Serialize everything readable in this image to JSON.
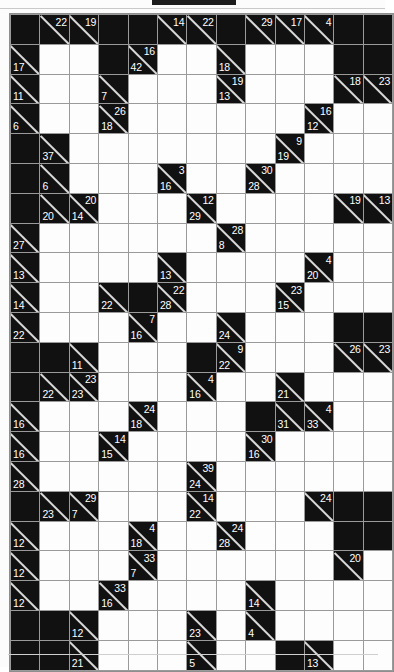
{
  "puzzle": {
    "type": "kakuro",
    "columns": 13,
    "rows": 22,
    "colors": {
      "block": "#111111",
      "open": "#fdfdfd",
      "grid_line": "#9a9a9a",
      "clue_text": "#ffffff",
      "diagonal": "#d8d8d8"
    },
    "legend": {
      "across_label": "across-clue (upper-right)",
      "down_label": "down-clue (lower-left)"
    },
    "cells": [
      [
        {
          "t": "b"
        },
        {
          "t": "c",
          "a": 22
        },
        {
          "t": "c",
          "a": 19
        },
        {
          "t": "b"
        },
        {
          "t": "b"
        },
        {
          "t": "c",
          "a": 14
        },
        {
          "t": "c",
          "a": 22
        },
        {
          "t": "b"
        },
        {
          "t": "c",
          "a": 29
        },
        {
          "t": "c",
          "a": 17
        },
        {
          "t": "c",
          "a": 4
        },
        {
          "t": "b"
        },
        {
          "t": "b"
        }
      ],
      [
        {
          "t": "c",
          "d": 17
        },
        {
          "t": "o"
        },
        {
          "t": "o"
        },
        {
          "t": "b"
        },
        {
          "t": "c",
          "a": 16,
          "d": 42
        },
        {
          "t": "o"
        },
        {
          "t": "o"
        },
        {
          "t": "c",
          "d": 18
        },
        {
          "t": "o"
        },
        {
          "t": "o"
        },
        {
          "t": "o"
        },
        {
          "t": "b"
        },
        {
          "t": "b"
        }
      ],
      [
        {
          "t": "c",
          "d": 11
        },
        {
          "t": "o"
        },
        {
          "t": "o"
        },
        {
          "t": "c",
          "d": 7
        },
        {
          "t": "o"
        },
        {
          "t": "o"
        },
        {
          "t": "o"
        },
        {
          "t": "c",
          "a": 19,
          "d": 13
        },
        {
          "t": "o"
        },
        {
          "t": "o"
        },
        {
          "t": "o"
        },
        {
          "t": "c",
          "a": 18
        },
        {
          "t": "c",
          "a": 23
        }
      ],
      [
        {
          "t": "c",
          "d": 6
        },
        {
          "t": "o"
        },
        {
          "t": "o"
        },
        {
          "t": "c",
          "a": 26,
          "d": 18
        },
        {
          "t": "o"
        },
        {
          "t": "o"
        },
        {
          "t": "o"
        },
        {
          "t": "o"
        },
        {
          "t": "o"
        },
        {
          "t": "o"
        },
        {
          "t": "c",
          "a": 16,
          "d": 12
        },
        {
          "t": "o"
        },
        {
          "t": "o"
        }
      ],
      [
        {
          "t": "b"
        },
        {
          "t": "c",
          "d": 37
        },
        {
          "t": "o"
        },
        {
          "t": "o"
        },
        {
          "t": "o"
        },
        {
          "t": "o"
        },
        {
          "t": "o"
        },
        {
          "t": "o"
        },
        {
          "t": "o"
        },
        {
          "t": "c",
          "a": 9,
          "d": 19
        },
        {
          "t": "o"
        },
        {
          "t": "o"
        },
        {
          "t": "o"
        }
      ],
      [
        {
          "t": "b"
        },
        {
          "t": "c",
          "d": 6
        },
        {
          "t": "o"
        },
        {
          "t": "o"
        },
        {
          "t": "o"
        },
        {
          "t": "c",
          "a": 3,
          "d": 16
        },
        {
          "t": "o"
        },
        {
          "t": "o"
        },
        {
          "t": "c",
          "a": 30,
          "d": 28
        },
        {
          "t": "o"
        },
        {
          "t": "o"
        },
        {
          "t": "o"
        },
        {
          "t": "o"
        }
      ],
      [
        {
          "t": "b"
        },
        {
          "t": "c",
          "d": 20
        },
        {
          "t": "c",
          "a": 20,
          "d": 14
        },
        {
          "t": "o"
        },
        {
          "t": "o"
        },
        {
          "t": "o"
        },
        {
          "t": "c",
          "a": 12,
          "d": 29
        },
        {
          "t": "o"
        },
        {
          "t": "o"
        },
        {
          "t": "o"
        },
        {
          "t": "o"
        },
        {
          "t": "c",
          "a": 19
        },
        {
          "t": "c",
          "a": 13
        }
      ],
      [
        {
          "t": "c",
          "d": 27
        },
        {
          "t": "o"
        },
        {
          "t": "o"
        },
        {
          "t": "o"
        },
        {
          "t": "o"
        },
        {
          "t": "o"
        },
        {
          "t": "o"
        },
        {
          "t": "c",
          "a": 28,
          "d": 8
        },
        {
          "t": "o"
        },
        {
          "t": "o"
        },
        {
          "t": "o"
        },
        {
          "t": "o"
        },
        {
          "t": "o"
        }
      ],
      [
        {
          "t": "c",
          "d": 13
        },
        {
          "t": "o"
        },
        {
          "t": "o"
        },
        {
          "t": "o"
        },
        {
          "t": "o"
        },
        {
          "t": "c",
          "d": 13
        },
        {
          "t": "o"
        },
        {
          "t": "o"
        },
        {
          "t": "o"
        },
        {
          "t": "o"
        },
        {
          "t": "c",
          "a": 4,
          "d": 20
        },
        {
          "t": "o"
        },
        {
          "t": "o"
        }
      ],
      [
        {
          "t": "c",
          "d": 14
        },
        {
          "t": "o"
        },
        {
          "t": "o"
        },
        {
          "t": "c",
          "d": 22
        },
        {
          "t": "b"
        },
        {
          "t": "c",
          "a": 22,
          "d": 28
        },
        {
          "t": "o"
        },
        {
          "t": "o"
        },
        {
          "t": "o"
        },
        {
          "t": "c",
          "a": 23,
          "d": 15
        },
        {
          "t": "o"
        },
        {
          "t": "o"
        },
        {
          "t": "o"
        }
      ],
      [
        {
          "t": "c",
          "d": 22
        },
        {
          "t": "o"
        },
        {
          "t": "o"
        },
        {
          "t": "o"
        },
        {
          "t": "c",
          "a": 7,
          "d": 16
        },
        {
          "t": "o"
        },
        {
          "t": "o"
        },
        {
          "t": "c",
          "d": 24
        },
        {
          "t": "o"
        },
        {
          "t": "o"
        },
        {
          "t": "o"
        },
        {
          "t": "b"
        },
        {
          "t": "b"
        }
      ],
      [
        {
          "t": "b"
        },
        {
          "t": "b"
        },
        {
          "t": "c",
          "d": 11
        },
        {
          "t": "o"
        },
        {
          "t": "o"
        },
        {
          "t": "o"
        },
        {
          "t": "b"
        },
        {
          "t": "c",
          "a": 9,
          "d": 22
        },
        {
          "t": "o"
        },
        {
          "t": "o"
        },
        {
          "t": "o"
        },
        {
          "t": "c",
          "a": 26
        },
        {
          "t": "c",
          "a": 23
        }
      ],
      [
        {
          "t": "b"
        },
        {
          "t": "c",
          "d": 22
        },
        {
          "t": "c",
          "a": 23,
          "d": 23
        },
        {
          "t": "o"
        },
        {
          "t": "o"
        },
        {
          "t": "o"
        },
        {
          "t": "c",
          "a": 4,
          "d": 16
        },
        {
          "t": "o"
        },
        {
          "t": "o"
        },
        {
          "t": "c",
          "d": 21
        },
        {
          "t": "o"
        },
        {
          "t": "o"
        },
        {
          "t": "o"
        }
      ],
      [
        {
          "t": "c",
          "d": 16
        },
        {
          "t": "o"
        },
        {
          "t": "o"
        },
        {
          "t": "o"
        },
        {
          "t": "c",
          "a": 24,
          "d": 18
        },
        {
          "t": "o"
        },
        {
          "t": "o"
        },
        {
          "t": "o"
        },
        {
          "t": "b"
        },
        {
          "t": "c",
          "d": 31
        },
        {
          "t": "c",
          "a": 4,
          "d": 33
        },
        {
          "t": "o"
        },
        {
          "t": "o"
        }
      ],
      [
        {
          "t": "c",
          "d": 16
        },
        {
          "t": "o"
        },
        {
          "t": "o"
        },
        {
          "t": "c",
          "a": 14,
          "d": 15
        },
        {
          "t": "o"
        },
        {
          "t": "o"
        },
        {
          "t": "o"
        },
        {
          "t": "o"
        },
        {
          "t": "c",
          "a": 30,
          "d": 16
        },
        {
          "t": "o"
        },
        {
          "t": "o"
        },
        {
          "t": "o"
        },
        {
          "t": "o"
        }
      ],
      [
        {
          "t": "c",
          "d": 28
        },
        {
          "t": "o"
        },
        {
          "t": "o"
        },
        {
          "t": "o"
        },
        {
          "t": "o"
        },
        {
          "t": "o"
        },
        {
          "t": "c",
          "a": 39,
          "d": 24
        },
        {
          "t": "o"
        },
        {
          "t": "o"
        },
        {
          "t": "o"
        },
        {
          "t": "o"
        },
        {
          "t": "o"
        },
        {
          "t": "o"
        }
      ],
      [
        {
          "t": "b"
        },
        {
          "t": "c",
          "d": 23
        },
        {
          "t": "c",
          "a": 29,
          "d": 7
        },
        {
          "t": "o"
        },
        {
          "t": "o"
        },
        {
          "t": "o"
        },
        {
          "t": "c",
          "a": 14,
          "d": 22
        },
        {
          "t": "o"
        },
        {
          "t": "o"
        },
        {
          "t": "o"
        },
        {
          "t": "c",
          "a": 24
        },
        {
          "t": "b"
        },
        {
          "t": "b"
        }
      ],
      [
        {
          "t": "c",
          "d": 12
        },
        {
          "t": "o"
        },
        {
          "t": "o"
        },
        {
          "t": "o"
        },
        {
          "t": "c",
          "a": 4,
          "d": 18
        },
        {
          "t": "o"
        },
        {
          "t": "o"
        },
        {
          "t": "c",
          "a": 24,
          "d": 28
        },
        {
          "t": "o"
        },
        {
          "t": "o"
        },
        {
          "t": "o"
        },
        {
          "t": "b"
        },
        {
          "t": "b"
        }
      ],
      [
        {
          "t": "c",
          "d": 12
        },
        {
          "t": "o"
        },
        {
          "t": "o"
        },
        {
          "t": "o"
        },
        {
          "t": "c",
          "a": 33,
          "d": 7
        },
        {
          "t": "o"
        },
        {
          "t": "o"
        },
        {
          "t": "o"
        },
        {
          "t": "o"
        },
        {
          "t": "o"
        },
        {
          "t": "o"
        },
        {
          "t": "c",
          "a": 20
        },
        {
          "t": "o"
        }
      ],
      [
        {
          "t": "c",
          "d": 12
        },
        {
          "t": "o"
        },
        {
          "t": "o"
        },
        {
          "t": "c",
          "a": 33,
          "d": 16
        },
        {
          "t": "o"
        },
        {
          "t": "o"
        },
        {
          "t": "o"
        },
        {
          "t": "o"
        },
        {
          "t": "c",
          "d": 14
        },
        {
          "t": "o"
        },
        {
          "t": "o"
        },
        {
          "t": "o"
        },
        {
          "t": "o"
        }
      ],
      [
        {
          "t": "b"
        },
        {
          "t": "b"
        },
        {
          "t": "c",
          "d": 12
        },
        {
          "t": "o"
        },
        {
          "t": "o"
        },
        {
          "t": "o"
        },
        {
          "t": "c",
          "d": 23
        },
        {
          "t": "o"
        },
        {
          "t": "c",
          "d": 4
        },
        {
          "t": "o"
        },
        {
          "t": "o"
        },
        {
          "t": "o"
        },
        {
          "t": "o"
        }
      ],
      [
        {
          "t": "b"
        },
        {
          "t": "b"
        },
        {
          "t": "c",
          "d": 21
        },
        {
          "t": "o"
        },
        {
          "t": "o"
        },
        {
          "t": "o"
        },
        {
          "t": "c",
          "d": 5
        },
        {
          "t": "o"
        },
        {
          "t": "o"
        },
        {
          "t": "b"
        },
        {
          "t": "c",
          "d": 13
        },
        {
          "t": "o"
        },
        {
          "t": "o"
        }
      ]
    ]
  }
}
